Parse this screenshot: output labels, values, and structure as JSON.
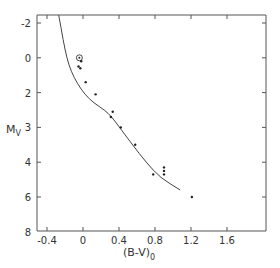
{
  "chart_data": {
    "type": "scatter",
    "title": "",
    "xlabel": "(B-V)",
    "xlabel_subscript": "0",
    "ylabel": "M",
    "ylabel_subscript": "V",
    "xlim": [
      -0.55,
      2.05
    ],
    "ylim_inverted": true,
    "x_ticks": [
      {
        "label": "-0.4",
        "value": -0.4
      },
      {
        "label": "0",
        "value": 0
      },
      {
        "label": "0.4",
        "value": 0.4
      },
      {
        "label": "0.8",
        "value": 0.8
      },
      {
        "label": "1.2",
        "value": 1.2
      },
      {
        "label": "1.6",
        "value": 1.6
      }
    ],
    "y_tick_labels": [
      "-2",
      "0",
      "2",
      "3",
      "4",
      "6",
      "8"
    ],
    "grid": false,
    "legend": null,
    "series": [
      {
        "name": "stars",
        "kind": "points",
        "points": [
          {
            "bv": -0.04,
            "mv": 0.0,
            "symbol": "sun"
          },
          {
            "bv": -0.02,
            "mv": 0.2
          },
          {
            "bv": -0.05,
            "mv": 0.5
          },
          {
            "bv": -0.03,
            "mv": 0.6
          },
          {
            "bv": 0.03,
            "mv": 1.4
          },
          {
            "bv": 0.14,
            "mv": 2.1
          },
          {
            "bv": 0.33,
            "mv": 3.1
          },
          {
            "bv": 0.31,
            "mv": 3.4
          },
          {
            "bv": 0.42,
            "mv": 4.0
          },
          {
            "bv": 0.58,
            "mv": 5.0
          },
          {
            "bv": 0.78,
            "mv": 6.7
          },
          {
            "bv": 0.9,
            "mv": 6.3
          },
          {
            "bv": 0.9,
            "mv": 6.5
          },
          {
            "bv": 0.9,
            "mv": 6.7
          },
          {
            "bv": 1.21,
            "mv": 8.0
          }
        ]
      },
      {
        "name": "reference sequence",
        "kind": "line",
        "points": [
          {
            "bv": -0.27,
            "mv": -2.5
          },
          {
            "bv": -0.22,
            "mv": -1.0
          },
          {
            "bv": -0.18,
            "mv": 0.0
          },
          {
            "bv": -0.13,
            "mv": 0.8
          },
          {
            "bv": -0.06,
            "mv": 1.5
          },
          {
            "bv": 0.02,
            "mv": 2.1
          },
          {
            "bv": 0.12,
            "mv": 2.6
          },
          {
            "bv": 0.24,
            "mv": 3.0
          },
          {
            "bv": 0.32,
            "mv": 3.4
          },
          {
            "bv": 0.42,
            "mv": 4.1
          },
          {
            "bv": 0.55,
            "mv": 5.0
          },
          {
            "bv": 0.7,
            "mv": 6.0
          },
          {
            "bv": 0.86,
            "mv": 6.9
          },
          {
            "bv": 1.08,
            "mv": 7.6
          }
        ]
      }
    ]
  }
}
